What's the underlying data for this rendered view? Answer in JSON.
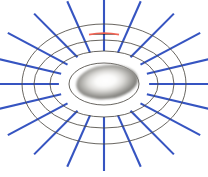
{
  "figure": {
    "background_color": "#ffffff",
    "width": 208,
    "height": 177
  },
  "chart_data": {
    "type": "diagram",
    "center": {
      "x": 104,
      "y": 84
    },
    "colors": {
      "ring_stroke": "#4a4640",
      "radial_stroke": "#2b4cbe",
      "highlight_stroke": "#f4604f",
      "body_dark": "#555450",
      "body_mid": "#9c9b97",
      "body_highlight": "#ffffff",
      "background": "#ffffff"
    },
    "body": {
      "name": "central-ellipsoid",
      "shape": "ellipsoid",
      "cx": 107,
      "cy": 82,
      "rx": 31,
      "ry": 17,
      "rotation_deg": -7,
      "shading": "radial-gradient-highlight"
    },
    "rings": {
      "count": 4,
      "shape": "ellipse",
      "cx": 104,
      "cy": 84,
      "radii": [
        {
          "index": 1,
          "rx": 35,
          "ry": 21
        },
        {
          "index": 2,
          "rx": 54,
          "ry": 33
        },
        {
          "index": 3,
          "rx": 70,
          "ry": 44
        },
        {
          "index": 4,
          "rx": 82,
          "ry": 60
        }
      ]
    },
    "radial_lines": {
      "count": 20,
      "angles_deg": [
        0,
        18,
        36,
        54,
        72,
        90,
        108,
        126,
        144,
        162,
        180,
        198,
        216,
        234,
        252,
        270,
        288,
        306,
        324,
        342
      ],
      "inner_radius_fraction": 0.55,
      "outer_radius_fraction": 1.45
    },
    "highlight": {
      "name": "highlighted-arc-segment",
      "color": "#f4604f",
      "on_ring_index": 2,
      "approx_x_start": 89,
      "approx_x_end": 119,
      "approx_y": 34,
      "length_px": 30
    },
    "legend": [],
    "annotations": []
  }
}
